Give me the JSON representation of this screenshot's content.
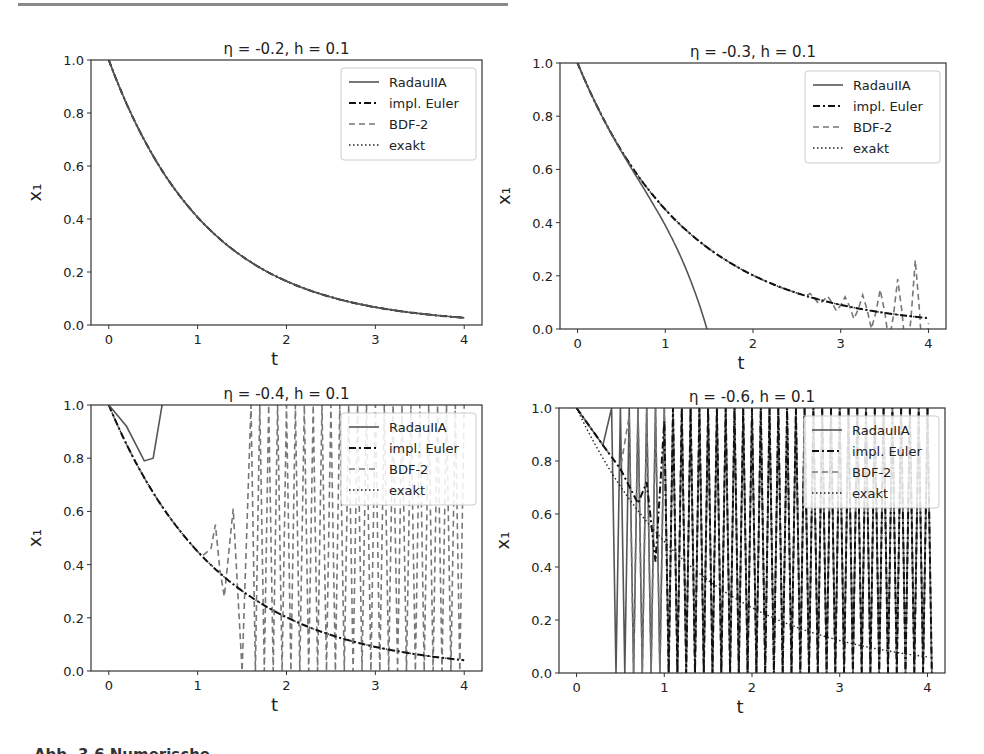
{
  "figure": {
    "caption_fragment": "Abb. 3.6 Numerische",
    "colors": {
      "radau": "#555555",
      "euler": "#111111",
      "bdf2": "#777777",
      "exakt": "#222222",
      "axis": "#333333"
    }
  },
  "chart_data": [
    {
      "type": "line",
      "title": "η = -0.2, h = 0.1",
      "xlabel": "t",
      "ylabel": "x₁",
      "xlim": [
        -0.2,
        4.2
      ],
      "ylim": [
        0.0,
        1.0
      ],
      "xticks": [
        "0",
        "1",
        "2",
        "3",
        "4"
      ],
      "yticks": [
        "0.0",
        "0.2",
        "0.4",
        "0.6",
        "0.8",
        "1.0"
      ],
      "legend": [
        "RadauIIA",
        "impl. Euler",
        "BDF-2",
        "exakt"
      ],
      "legend_position": "upper right",
      "x": [
        0,
        0.5,
        1,
        1.5,
        2,
        2.5,
        3,
        3.5,
        4
      ],
      "series": [
        {
          "name": "RadauIIA",
          "style": "solid",
          "values": [
            1.0,
            0.64,
            0.43,
            0.29,
            0.19,
            0.125,
            0.08,
            0.05,
            0.03
          ]
        },
        {
          "name": "impl. Euler",
          "style": "dashdot",
          "values": [
            1.0,
            0.64,
            0.43,
            0.29,
            0.19,
            0.125,
            0.08,
            0.05,
            0.03
          ]
        },
        {
          "name": "BDF-2",
          "style": "dashed",
          "values": [
            1.0,
            0.64,
            0.43,
            0.29,
            0.19,
            0.125,
            0.08,
            0.05,
            0.03
          ]
        },
        {
          "name": "exakt",
          "style": "dotted",
          "values": [
            1.0,
            0.64,
            0.43,
            0.29,
            0.19,
            0.125,
            0.08,
            0.05,
            0.03
          ]
        }
      ]
    },
    {
      "type": "line",
      "title": "η = -0.3, h = 0.1",
      "xlabel": "t",
      "ylabel": "x₁",
      "xlim": [
        -0.2,
        4.2
      ],
      "ylim": [
        0.0,
        1.0
      ],
      "xticks": [
        "0",
        "1",
        "2",
        "3",
        "4"
      ],
      "yticks": [
        "0.0",
        "0.2",
        "0.4",
        "0.6",
        "0.8",
        "1.0"
      ],
      "legend": [
        "RadauIIA",
        "impl. Euler",
        "BDF-2",
        "exakt"
      ],
      "legend_position": "upper right",
      "x": [
        0,
        0.5,
        1,
        1.5,
        2,
        2.5,
        3,
        3.5,
        4
      ],
      "series": [
        {
          "name": "RadauIIA",
          "style": "solid",
          "note": "diverges to 0 at t≈1.75",
          "values": [
            1.0,
            0.7,
            0.47,
            0.2,
            null,
            null,
            null,
            null,
            null
          ]
        },
        {
          "name": "impl. Euler",
          "style": "dashdot",
          "values": [
            1.0,
            0.7,
            0.47,
            0.32,
            0.22,
            0.15,
            0.1,
            0.065,
            0.04
          ]
        },
        {
          "name": "BDF-2",
          "style": "dashed",
          "note": "oscillates with growing amplitude after t≈2.7, peak ≈0.23 at t≈3.9",
          "values": [
            1.0,
            0.7,
            0.47,
            0.32,
            0.22,
            0.15,
            0.1,
            0.13,
            0.23
          ]
        },
        {
          "name": "exakt",
          "style": "dotted",
          "values": [
            1.0,
            0.7,
            0.47,
            0.32,
            0.22,
            0.15,
            0.1,
            0.065,
            0.04
          ]
        }
      ]
    },
    {
      "type": "line",
      "title": "η = -0.4, h = 0.1",
      "xlabel": "t",
      "ylabel": "x₁",
      "xlim": [
        -0.2,
        4.2
      ],
      "ylim": [
        0.0,
        1.0
      ],
      "xticks": [
        "0",
        "1",
        "2",
        "3",
        "4"
      ],
      "yticks": [
        "0.0",
        "0.2",
        "0.4",
        "0.6",
        "0.8",
        "1.0"
      ],
      "legend": [
        "RadauIIA",
        "impl. Euler",
        "BDF-2",
        "exakt"
      ],
      "legend_position": "upper right",
      "x": [
        0,
        0.5,
        1,
        1.5,
        2,
        2.5,
        3,
        3.5,
        4
      ],
      "series": [
        {
          "name": "RadauIIA",
          "style": "solid",
          "note": "dips to ≈0.79 at t≈0.4, then leaves plot above 1.0 at t≈0.6",
          "values": [
            1.0,
            0.8,
            null,
            null,
            null,
            null,
            null,
            null,
            null
          ]
        },
        {
          "name": "impl. Euler",
          "style": "dashdot",
          "values": [
            1.0,
            0.76,
            0.53,
            0.35,
            0.24,
            0.16,
            0.11,
            0.07,
            0.04
          ]
        },
        {
          "name": "BDF-2",
          "style": "dashed",
          "note": "starts oscillating at t≈1.1, full-range oscillation 0–1 from t≈1.5 onward",
          "values": [
            1.0,
            0.76,
            0.53,
            0.0,
            1.0,
            1.0,
            1.0,
            1.0,
            1.0
          ]
        },
        {
          "name": "exakt",
          "style": "dotted",
          "values": [
            1.0,
            0.76,
            0.53,
            0.35,
            0.24,
            0.16,
            0.11,
            0.07,
            0.04
          ]
        }
      ]
    },
    {
      "type": "line",
      "title": "η = -0.6, h = 0.1",
      "xlabel": "t",
      "ylabel": "x₁",
      "xlim": [
        -0.2,
        4.2
      ],
      "ylim": [
        0.0,
        1.0
      ],
      "xticks": [
        "0",
        "1",
        "2",
        "3",
        "4"
      ],
      "yticks": [
        "0.0",
        "0.2",
        "0.4",
        "0.6",
        "0.8",
        "1.0"
      ],
      "legend": [
        "RadauIIA",
        "impl. Euler",
        "BDF-2",
        "exakt"
      ],
      "legend_position": "upper right",
      "x": [
        0,
        0.5,
        1,
        1.5,
        2,
        2.5,
        3,
        3.5,
        4
      ],
      "series": [
        {
          "name": "RadauIIA",
          "style": "solid",
          "note": "full-range oscillation 0–1 from t≈0.45 onward",
          "values": [
            1.0,
            0.0,
            1.0,
            1.0,
            1.0,
            1.0,
            1.0,
            1.0,
            1.0
          ]
        },
        {
          "name": "impl. Euler",
          "style": "dashdot",
          "note": "full-range oscillation from t≈0.9 onward",
          "values": [
            1.0,
            0.77,
            0.5,
            1.0,
            1.0,
            1.0,
            1.0,
            1.0,
            1.0
          ]
        },
        {
          "name": "BDF-2",
          "style": "dashed",
          "note": "full-range oscillation from t≈0.6 onward",
          "values": [
            1.0,
            0.78,
            1.0,
            1.0,
            1.0,
            1.0,
            1.0,
            1.0,
            1.0
          ]
        },
        {
          "name": "exakt",
          "style": "dotted",
          "values": [
            1.0,
            0.78,
            0.6,
            0.43,
            0.3,
            0.22,
            0.15,
            0.1,
            0.06
          ]
        }
      ]
    }
  ]
}
